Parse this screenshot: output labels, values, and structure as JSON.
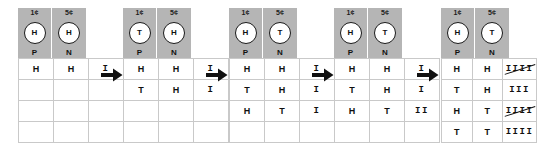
{
  "diagram": {
    "arrow_icon": "right-arrow-icon",
    "coin_labels": {
      "penny_denomination": "1¢",
      "nickel_denomination": "5¢",
      "penny_abbr": "P",
      "nickel_abbr": "N"
    },
    "colors": {
      "header_gray": "#b5b5b5",
      "grid_line": "#c9c9c9",
      "text": "#101010",
      "arrow": "#111111",
      "coin_face": "#ffffff"
    },
    "panels": [
      {
        "name": "panel-1",
        "coins": [
          {
            "denomination": "1¢",
            "face": "H",
            "abbr": "P"
          },
          {
            "denomination": "5¢",
            "face": "H",
            "abbr": "N"
          }
        ],
        "rows": [
          {
            "penny": "H",
            "nickel": "H",
            "tally": "I",
            "count": 1
          },
          {
            "penny": "",
            "nickel": "",
            "tally": "",
            "count": 0
          },
          {
            "penny": "",
            "nickel": "",
            "tally": "",
            "count": 0
          },
          {
            "penny": "",
            "nickel": "",
            "tally": "",
            "count": 0
          }
        ]
      },
      {
        "name": "panel-2",
        "coins": [
          {
            "denomination": "1¢",
            "face": "T",
            "abbr": "P"
          },
          {
            "denomination": "5¢",
            "face": "H",
            "abbr": "N"
          }
        ],
        "rows": [
          {
            "penny": "H",
            "nickel": "H",
            "tally": "I",
            "count": 1
          },
          {
            "penny": "T",
            "nickel": "H",
            "tally": "I",
            "count": 1
          },
          {
            "penny": "",
            "nickel": "",
            "tally": "",
            "count": 0
          },
          {
            "penny": "",
            "nickel": "",
            "tally": "",
            "count": 0
          }
        ]
      },
      {
        "name": "panel-3",
        "coins": [
          {
            "denomination": "1¢",
            "face": "H",
            "abbr": "P"
          },
          {
            "denomination": "5¢",
            "face": "T",
            "abbr": "N"
          }
        ],
        "rows": [
          {
            "penny": "H",
            "nickel": "H",
            "tally": "I",
            "count": 1
          },
          {
            "penny": "T",
            "nickel": "H",
            "tally": "I",
            "count": 1
          },
          {
            "penny": "H",
            "nickel": "T",
            "tally": "I",
            "count": 1
          },
          {
            "penny": "",
            "nickel": "",
            "tally": "",
            "count": 0
          }
        ]
      },
      {
        "name": "panel-4",
        "coins": [
          {
            "denomination": "1¢",
            "face": "H",
            "abbr": "P"
          },
          {
            "denomination": "5¢",
            "face": "T",
            "abbr": "N"
          }
        ],
        "rows": [
          {
            "penny": "H",
            "nickel": "H",
            "tally": "I",
            "count": 1
          },
          {
            "penny": "T",
            "nickel": "H",
            "tally": "I",
            "count": 1
          },
          {
            "penny": "H",
            "nickel": "T",
            "tally": "II",
            "count": 2
          },
          {
            "penny": "",
            "nickel": "",
            "tally": "",
            "count": 0
          }
        ]
      },
      {
        "name": "panel-5",
        "coins": [
          {
            "denomination": "1¢",
            "face": "H",
            "abbr": "P"
          },
          {
            "denomination": "5¢",
            "face": "T",
            "abbr": "N"
          }
        ],
        "rows": [
          {
            "penny": "H",
            "nickel": "H",
            "tally": "IIII̸",
            "count": 5
          },
          {
            "penny": "T",
            "nickel": "H",
            "tally": "III",
            "count": 3
          },
          {
            "penny": "H",
            "nickel": "T",
            "tally": "IIII̸",
            "count": 5
          },
          {
            "penny": "T",
            "nickel": "T",
            "tally": "IIII",
            "count": 4
          }
        ]
      }
    ]
  }
}
